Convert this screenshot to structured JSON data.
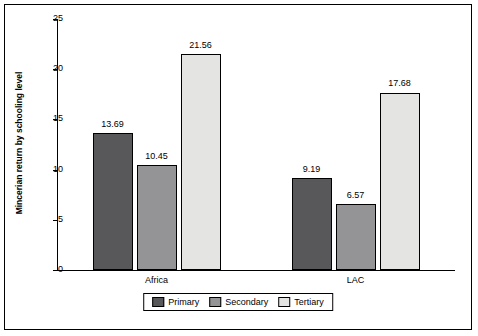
{
  "chart_data": {
    "type": "bar",
    "title": "",
    "xlabel": "",
    "ylabel": "Mincerian return by schooling level",
    "categories": [
      "Africa",
      "LAC"
    ],
    "series": [
      {
        "name": "Primary",
        "color": "#58585a",
        "values": [
          13.69,
          9.19
        ]
      },
      {
        "name": "Secondary",
        "color": "#949497",
        "values": [
          10.45,
          6.57
        ]
      },
      {
        "name": "Tertiary",
        "color": "#e4e4e2",
        "values": [
          21.56,
          17.68
        ]
      }
    ],
    "ylim": [
      0,
      25
    ],
    "yticks": [
      "0",
      "5",
      "10",
      "15",
      "20",
      "25"
    ],
    "ytick_values": [
      0,
      5,
      10,
      15,
      20,
      25
    ],
    "grid": false,
    "legend_position": "bottom-center",
    "value_labels": [
      "13.69",
      "10.45",
      "21.56",
      "9.19",
      "6.57",
      "17.68"
    ]
  },
  "legend": {
    "items": [
      {
        "label": "Primary"
      },
      {
        "label": "Secondary"
      },
      {
        "label": "Tertiary"
      }
    ]
  },
  "axis": {
    "y_title": "Mincerian return by schooling level"
  }
}
